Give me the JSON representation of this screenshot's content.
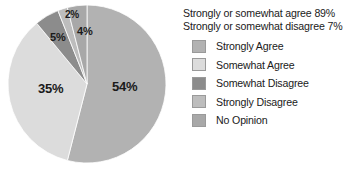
{
  "summary": {
    "line1": "Strongly or somewhat agree 89%",
    "line2": "Strongly or somewhat disagree 7%"
  },
  "legend": {
    "items": [
      {
        "label": "Strongly Agree",
        "color": "#b2b2b2"
      },
      {
        "label": "Somewhat Agree",
        "color": "#dcdcdc"
      },
      {
        "label": "Somewhat Disagree",
        "color": "#8c8c8c"
      },
      {
        "label": "Strongly Disagree",
        "color": "#bdbdbd"
      },
      {
        "label": "No Opinion",
        "color": "#a8a8a8"
      }
    ]
  },
  "chart_data": {
    "type": "pie",
    "title": "",
    "categories": [
      "Strongly Agree",
      "Somewhat Agree",
      "Somewhat Disagree",
      "Strongly Disagree",
      "No Opinion"
    ],
    "values": [
      54,
      35,
      5,
      2,
      4
    ],
    "value_labels": [
      "54%",
      "35%",
      "5%",
      "2%",
      "4%"
    ],
    "colors": [
      "#b2b2b2",
      "#dcdcdc",
      "#8c8c8c",
      "#bdbdbd",
      "#a8a8a8"
    ],
    "units": "percent",
    "legend_position": "right",
    "start_angle_deg": 0,
    "direction": "clockwise",
    "annotations": [
      "Strongly or somewhat agree 89%",
      "Strongly or somewhat disagree 7%"
    ],
    "label_positions": [
      {
        "text": "54%",
        "x": 112,
        "y": 80,
        "font_size": 13
      },
      {
        "text": "35%",
        "x": 38,
        "y": 82,
        "font_size": 13
      },
      {
        "text": "5%",
        "x": 50,
        "y": 32,
        "font_size": 11
      },
      {
        "text": "2%",
        "x": 65,
        "y": 10,
        "font_size": 10
      },
      {
        "text": "4%",
        "x": 77,
        "y": 26,
        "font_size": 11
      }
    ],
    "geometry": {
      "cx": 87,
      "cy": 84,
      "r": 79
    }
  }
}
